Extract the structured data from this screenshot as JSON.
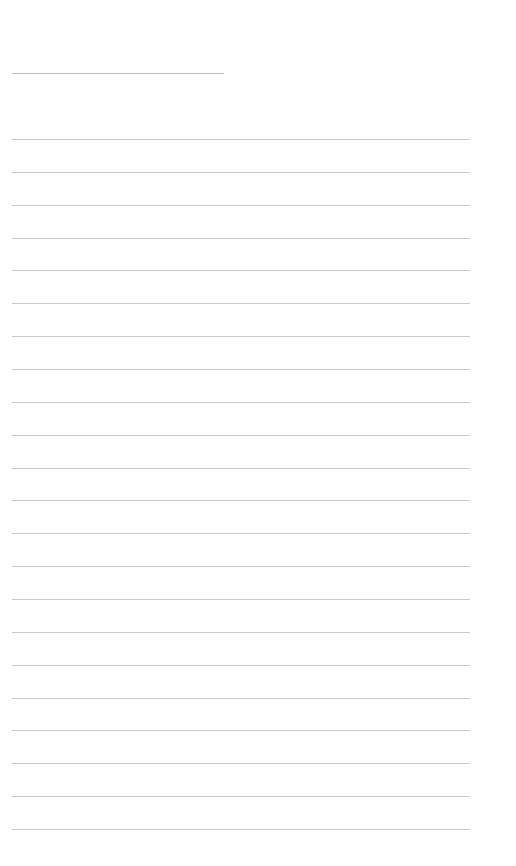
{
  "document": {
    "type": "blank lined paper",
    "header_line": {
      "x": 12,
      "y": 73,
      "width": 212
    },
    "ruled_lines": {
      "count": 22,
      "start_y": 139,
      "spacing": 32.86,
      "x": 12,
      "width": 458
    },
    "colors": {
      "paper": "#fefefe",
      "line": "#c8c8c8"
    }
  }
}
